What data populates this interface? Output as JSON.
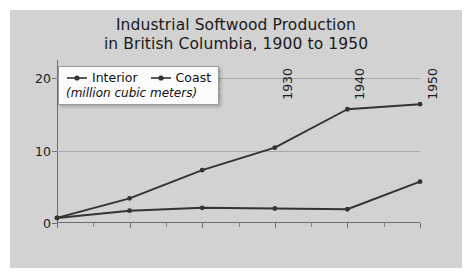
{
  "figure": {
    "background_color": "#d2d2d2",
    "page_background_color": "#ffffff",
    "title_line1": "Industrial Softwood Production",
    "title_line2": "in British Columbia, 1900 to 1950"
  },
  "legend": {
    "position": "top-left inside plot",
    "entries": [
      {
        "name": "Interior",
        "marker": "line-with-dot-marker",
        "color": "#333333"
      },
      {
        "name": "Coast",
        "marker": "line-with-dot-marker",
        "color": "#333333"
      }
    ],
    "subtitle": "(million cubic meters)"
  },
  "chart_data": {
    "type": "line",
    "title": "Industrial Softwood Production in British Columbia, 1900 to 1950",
    "xlabel": "",
    "ylabel": "",
    "unit_note": "(million cubic meters)",
    "x": [
      1900,
      1910,
      1920,
      1930,
      1940,
      1950
    ],
    "categories": [
      "1900",
      "1910",
      "1920",
      "1930",
      "1940",
      "1950"
    ],
    "series": [
      {
        "name": "Interior",
        "color": "#333333",
        "values": [
          0.7,
          3.4,
          7.3,
          10.4,
          15.7,
          16.4
        ]
      },
      {
        "name": "Coast",
        "color": "#333333",
        "values": [
          0.7,
          1.7,
          2.1,
          2.0,
          1.9,
          5.7
        ]
      }
    ],
    "xlim": [
      1900,
      1950
    ],
    "ylim": [
      0,
      22.5
    ],
    "yticks": [
      0,
      10,
      20
    ],
    "ytick_labels": [
      "0",
      "10",
      "20"
    ],
    "xticks": [
      1900,
      1910,
      1920,
      1930,
      1940,
      1950
    ],
    "xtick_labels": [
      "1900",
      "1910",
      "1920",
      "1930",
      "1940",
      "1950"
    ],
    "xtick_minor": [
      1905,
      1915,
      1925,
      1935,
      1945
    ],
    "xtick_label_rotation": 90,
    "grid": "horizontal",
    "gridline_color": "#aaaaaa",
    "axis_color": "#6e6e6e",
    "legend_position": "upper left"
  }
}
